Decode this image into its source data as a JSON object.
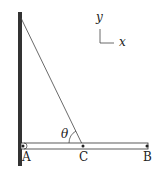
{
  "diagram": {
    "labels": {
      "a": "A",
      "b": "B",
      "c": "C",
      "theta": "θ",
      "axis_x": "x",
      "axis_y": "y"
    },
    "colors": {
      "wall": "#333333",
      "line": "#333333",
      "beam_fill": "#ffffff"
    }
  }
}
